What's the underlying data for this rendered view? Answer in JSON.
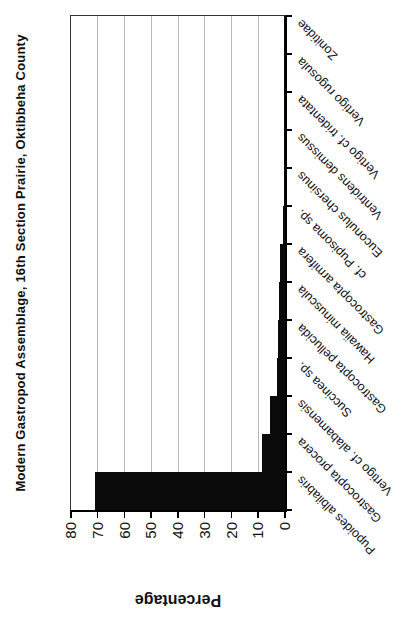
{
  "page": {
    "background": "#ffffff"
  },
  "chart_data": {
    "type": "bar",
    "title": "Modern Gastropod Assemblage, 16th Section Prairie, Oktibbeha County",
    "xlabel": "",
    "ylabel": "Percentage",
    "ylim": [
      0,
      80
    ],
    "y_tick_step": 10,
    "y_ticks": [
      80,
      70,
      60,
      50,
      40,
      30,
      20,
      10,
      0
    ],
    "grid": "on",
    "legend": "none",
    "rotation_deg": -90,
    "bar_color": "#0a0a0a",
    "gridline_color": "#b8b8b8",
    "categories": [
      "Pupoides albilabris",
      "Gastrocopta procera",
      "Vertigo cf. alabamensis",
      "Succinea sp.",
      "Gastrocopta pellucida",
      "Hawaiia minuscula",
      "Gastrocopta armifera",
      "cf. Pupisoma sp.",
      "Euconulus chersinus",
      "Ventridens demissus",
      "Vertigo cf. tridentata",
      "Vertigo rugosula",
      "Zonitidae"
    ],
    "values": [
      71,
      8.5,
      5.6,
      2.9,
      2.6,
      2.3,
      1.7,
      0.8,
      0.5,
      0.4,
      0.3,
      0.3,
      0.3
    ]
  }
}
